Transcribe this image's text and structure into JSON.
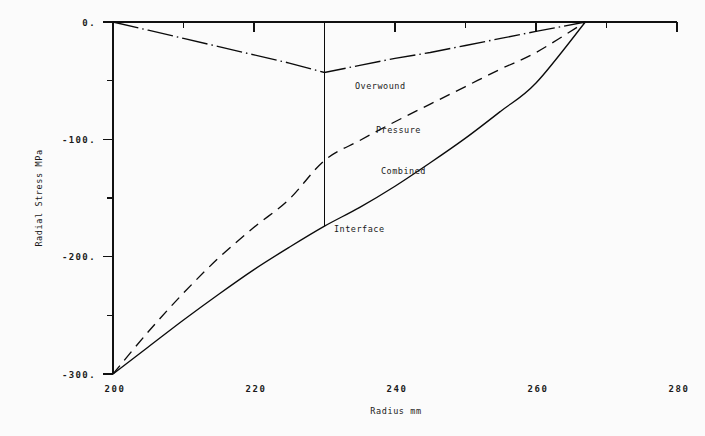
{
  "chart_data": {
    "type": "line",
    "title": "",
    "xlabel": "Radius mm",
    "ylabel": "Radial Stress MPa",
    "xlim": [
      200,
      280
    ],
    "ylim": [
      -300,
      0
    ],
    "xticks": [
      200,
      220,
      240,
      260,
      280
    ],
    "xtick_labels": [
      "200",
      "220",
      "240",
      "260",
      "280"
    ],
    "yticks": [
      0,
      -100,
      -200,
      -300
    ],
    "ytick_labels": [
      "0.",
      "-100.",
      "-200.",
      "-300."
    ],
    "minor_xticks": [
      210,
      230,
      250,
      270
    ],
    "minor_yticks": [
      -50,
      -150,
      -250
    ],
    "grid": false,
    "legend": "inline-annotations",
    "interface_radius": 230,
    "outer_radius": 267,
    "annotations": [
      {
        "text": "Overwound",
        "x": 233.5,
        "y": -54
      },
      {
        "text": "Pressure",
        "x": 238.5,
        "y": -109
      },
      {
        "text": "Combined",
        "x": 243.5,
        "y": -149
      },
      {
        "text": "Interface",
        "x": 233.0,
        "y": -190
      }
    ],
    "series": [
      {
        "name": "Overwound",
        "style": "dash-dot",
        "x": [
          200,
          205,
          210,
          215,
          220,
          225,
          230,
          235,
          240,
          245,
          250,
          255,
          260,
          267
        ],
        "y": [
          0,
          -7,
          -14,
          -21,
          -28,
          -35,
          -43,
          -37,
          -31,
          -26,
          -20,
          -14,
          -8,
          0
        ]
      },
      {
        "name": "Pressure",
        "style": "dashed",
        "x": [
          200,
          205,
          210,
          215,
          220,
          225,
          230,
          235,
          240,
          245,
          250,
          255,
          260,
          267
        ],
        "y": [
          -300,
          -264,
          -231,
          -201,
          -175,
          -151,
          -118,
          -101,
          -85,
          -70,
          -55,
          -40,
          -26,
          0
        ]
      },
      {
        "name": "Combined",
        "style": "solid",
        "x": [
          200,
          205,
          210,
          215,
          220,
          225,
          230,
          235,
          240,
          245,
          250,
          255,
          260,
          267
        ],
        "y": [
          -300,
          -277,
          -254,
          -232,
          -211,
          -192,
          -174,
          -158,
          -140,
          -120,
          -99,
          -76,
          -52,
          0
        ]
      }
    ]
  },
  "labels": {
    "overwound": "Overwound",
    "pressure": "Pressure",
    "combined": "Combined",
    "interface": "Interface",
    "x_axis_title": "Radius mm",
    "y_axis_title": "Radial Stress MPa",
    "ytick_0": "0.",
    "ytick_100": "-100.",
    "ytick_200": "-200.",
    "ytick_300": "-300.",
    "xtick_200": "200",
    "xtick_220": "220",
    "xtick_240": "240",
    "xtick_260": "260",
    "xtick_280": "280"
  }
}
